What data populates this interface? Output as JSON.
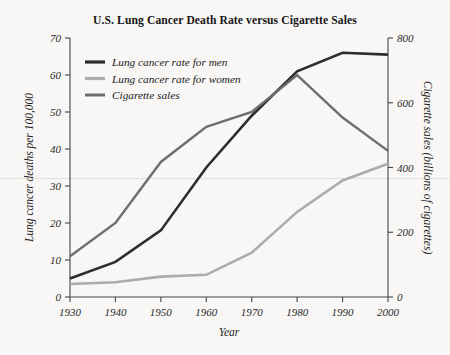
{
  "chart_data": {
    "type": "line",
    "title": "U.S. Lung Cancer Death Rate versus Cigarette Sales",
    "xlabel": "Year",
    "ylabel": "Lung cancer deaths per 100,000",
    "y2label": "Cigarette sales (billions of cigarettes)",
    "x": [
      1930,
      1940,
      1950,
      1960,
      1970,
      1980,
      1990,
      2000
    ],
    "categories": [
      "1930",
      "1940",
      "1950",
      "1960",
      "1970",
      "1980",
      "1990",
      "2000"
    ],
    "xlim": [
      1930,
      2000
    ],
    "ylim": [
      0,
      70
    ],
    "y2lim": [
      0,
      800
    ],
    "yticks": [
      0,
      10,
      20,
      30,
      40,
      50,
      60,
      70
    ],
    "ytick_labels": [
      "0",
      "10",
      "20",
      "30",
      "40",
      "50",
      "60",
      "70"
    ],
    "y2ticks": [
      0,
      200,
      400,
      600,
      800
    ],
    "y2tick_labels": [
      "0",
      "200",
      "400",
      "600",
      "800"
    ],
    "grid": false,
    "legend_position": "upper left",
    "series": [
      {
        "name": "Lung cancer rate for men",
        "axis": "left",
        "color": "#2d2d2d",
        "width": 2.6,
        "values": [
          5,
          9.5,
          18,
          35,
          49,
          61,
          66,
          65.5
        ]
      },
      {
        "name": "Lung cancer rate for women",
        "axis": "left",
        "color": "#acacac",
        "width": 2.6,
        "values": [
          3.5,
          4,
          5.5,
          6,
          12,
          23,
          31.5,
          36
        ]
      },
      {
        "name": "Cigarette sales",
        "axis": "right",
        "color": "#6e6e6e",
        "width": 2.4,
        "values_right": [
          125,
          225,
          415,
          525,
          570,
          680,
          555,
          450
        ],
        "values": [
          11,
          20,
          36.5,
          46,
          50,
          60,
          48.5,
          39.5
        ]
      }
    ]
  }
}
